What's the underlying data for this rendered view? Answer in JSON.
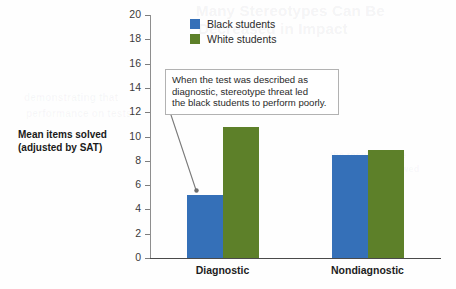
{
  "chart_data": {
    "type": "bar",
    "title": "",
    "xlabel": "",
    "ylabel": "Mean items solved (adjusted by SAT)",
    "ylabel_line1": "Mean items solved",
    "ylabel_line2": "(adjusted by SAT)",
    "ylim": [
      0,
      20
    ],
    "ytick_step": 2,
    "yticks": [
      20,
      18,
      16,
      14,
      12,
      10,
      8,
      6,
      4,
      2,
      0
    ],
    "grid": false,
    "legend_position": "top-center",
    "categories": [
      "Diagnostic",
      "Nondiagnostic"
    ],
    "series": [
      {
        "name": "Black students",
        "color": "#3570b8",
        "values": [
          5.2,
          8.5
        ]
      },
      {
        "name": "White students",
        "color": "#5d8029",
        "values": [
          10.8,
          8.9
        ]
      }
    ],
    "annotations": [
      {
        "id": "stereotype-threat-note",
        "text": "When the test was described as diagnostic, stereotype threat led the black students to perform poorly.",
        "lines": [
          "When the test was described as",
          "diagnostic, stereotype threat led",
          "the black students to perform poorly."
        ],
        "points_to": "Diagnostic / Black students bar"
      }
    ]
  },
  "legend": {
    "items": [
      {
        "label": "Black students",
        "color": "#3570b8"
      },
      {
        "label": "White students",
        "color": "#5d8029"
      }
    ]
  },
  "background_showthrough": {
    "line1": "Many Stereotypes Can Be",
    "line2": "Decreased in Impact",
    "line3": "demonstrating that",
    "line4": "performance on tests",
    "line5": "the results of the",
    "line6": "experiment showed"
  }
}
